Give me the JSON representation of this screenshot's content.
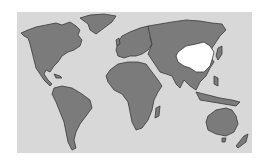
{
  "map": {
    "type": "world-map",
    "highlighted_region": "China",
    "colors": {
      "background": "#ffffff",
      "ocean": "#d8d8d8",
      "land": "#7b7b7b",
      "outline": "#3a3a3a",
      "highlight": "#ffffff"
    }
  }
}
